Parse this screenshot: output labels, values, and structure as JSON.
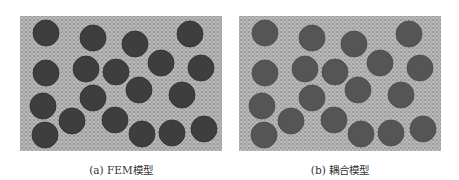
{
  "figure": {
    "panels": [
      {
        "id": "a",
        "caption": "(a) FEM模型",
        "matrix_color": "#9a9a9a",
        "inclusion_color": "#3e3e3e",
        "inclusion_stroke": "#2e2e2e"
      },
      {
        "id": "b",
        "caption": "(b) 耦合模型",
        "matrix_color": "#9c9c9c",
        "inclusion_color": "#555555",
        "inclusion_stroke": "#4a4a4a"
      }
    ],
    "inclusion_radius": 13,
    "inclusions": [
      [
        26,
        17
      ],
      [
        73,
        22
      ],
      [
        115,
        28
      ],
      [
        170,
        18
      ],
      [
        26,
        57
      ],
      [
        66,
        53
      ],
      [
        96,
        56
      ],
      [
        141,
        47
      ],
      [
        181,
        52
      ],
      [
        119,
        74
      ],
      [
        162,
        79
      ],
      [
        73,
        82
      ],
      [
        23,
        90
      ],
      [
        52,
        105
      ],
      [
        95,
        104
      ],
      [
        25,
        119
      ],
      [
        122,
        118
      ],
      [
        152,
        117
      ],
      [
        184,
        113
      ]
    ]
  }
}
